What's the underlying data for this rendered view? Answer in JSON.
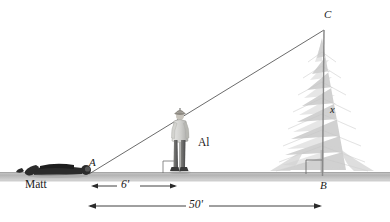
{
  "figure": {
    "type": "geometry-diagram",
    "colors": {
      "line": "#4a4a4a",
      "ground": "#b9b9b9",
      "tree": "#cfcfcf",
      "person_dark": "#2b2b2b",
      "label": "#1a1a1a",
      "background": "#ffffff"
    },
    "points": [
      {
        "id": "A",
        "label": "A",
        "x": 91,
        "y": 163
      },
      {
        "id": "B",
        "label": "B",
        "x": 322,
        "y": 185
      },
      {
        "id": "C",
        "label": "C",
        "x": 326,
        "y": 14
      }
    ],
    "people": [
      {
        "id": "matt",
        "label": "Matt",
        "pose": "lying-down",
        "label_x": 26,
        "label_y": 183
      },
      {
        "id": "al",
        "label": "Al",
        "pose": "standing",
        "label_x": 199,
        "label_y": 140
      }
    ],
    "segments": [
      {
        "id": "hypotenuse",
        "from": "A",
        "to": "C"
      },
      {
        "id": "tree-height",
        "from": "B",
        "to": "C",
        "label": "x"
      },
      {
        "id": "baseline",
        "from": "A",
        "to": "B"
      }
    ],
    "variables": [
      {
        "id": "tree-height-var",
        "label": "x",
        "x": 331,
        "y": 110
      }
    ],
    "dimensions": [
      {
        "id": "dim-6ft",
        "label": "6'",
        "value": 6,
        "unit": "feet",
        "from_x": 91,
        "to_x": 176,
        "y": 186,
        "label_x": 127,
        "label_y": 181
      },
      {
        "id": "dim-50ft",
        "label": "50'",
        "value": 50,
        "unit": "feet",
        "from_x": 88,
        "to_x": 322,
        "y": 206,
        "label_x": 196,
        "label_y": 200
      }
    ],
    "right_angles": [
      {
        "id": "right-angle-al",
        "x": 164,
        "y": 162,
        "size": 11
      },
      {
        "id": "right-angle-tree",
        "x": 306,
        "y": 161,
        "size": 16
      }
    ],
    "ground": {
      "top_y": 172,
      "bottom_y": 181
    }
  }
}
